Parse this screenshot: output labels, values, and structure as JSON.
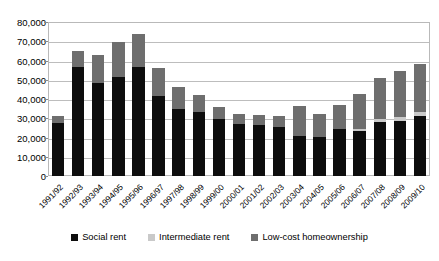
{
  "chart_data": {
    "type": "bar",
    "stacked": true,
    "title": "",
    "xlabel": "",
    "ylabel": "",
    "ylim": [
      0,
      80000
    ],
    "ytick_step": 10000,
    "ytick_labels": [
      "0",
      "10,000",
      "20,000",
      "30,000",
      "40,000",
      "50,000",
      "60,000",
      "70,000",
      "80,000"
    ],
    "ytick_values": [
      0,
      10000,
      20000,
      30000,
      40000,
      50000,
      60000,
      70000,
      80000
    ],
    "grid": true,
    "legend_position": "bottom",
    "categories": [
      "1991/92",
      "1992/93",
      "1993/94",
      "1994/95",
      "1995/96",
      "1996/97",
      "1997/98",
      "1998/99",
      "1999/00",
      "2000/01",
      "2001/02",
      "2002/03",
      "2003/04",
      "2004/05",
      "2005/06",
      "2006/07",
      "2007/08",
      "2008/09",
      "2009/10"
    ],
    "series": [
      {
        "name": "Social rent",
        "color": "#0d0d0d",
        "values": [
          27500,
          56500,
          48500,
          51500,
          56500,
          41500,
          35000,
          33000,
          29500,
          27000,
          26500,
          25500,
          21000,
          20500,
          24500,
          23500,
          28000,
          28500,
          31000
        ]
      },
      {
        "name": "Intermediate rent",
        "color": "#c9c9c9",
        "values": [
          0,
          0,
          0,
          0,
          0,
          0,
          0,
          0,
          0,
          0,
          0,
          0,
          0,
          0,
          0,
          1000,
          1500,
          2000,
          2000
        ]
      },
      {
        "name": "Low-cost homeownership",
        "color": "#6e6e6e",
        "values": [
          3500,
          8500,
          14500,
          18000,
          17500,
          14500,
          11500,
          9000,
          6500,
          5000,
          5000,
          5500,
          15500,
          11500,
          12500,
          18000,
          21500,
          24000,
          25000
        ]
      }
    ],
    "totals": [
      31000,
      65000,
      63000,
      69500,
      74000,
      56000,
      46500,
      42000,
      36000,
      32000,
      31500,
      31000,
      36500,
      32000,
      37000,
      42500,
      51000,
      54500,
      58000
    ]
  },
  "legend": {
    "items": [
      {
        "label": "Social rent",
        "color": "#0d0d0d"
      },
      {
        "label": "Intermediate rent",
        "color": "#c9c9c9"
      },
      {
        "label": "Low-cost homeownership",
        "color": "#6e6e6e"
      }
    ]
  }
}
